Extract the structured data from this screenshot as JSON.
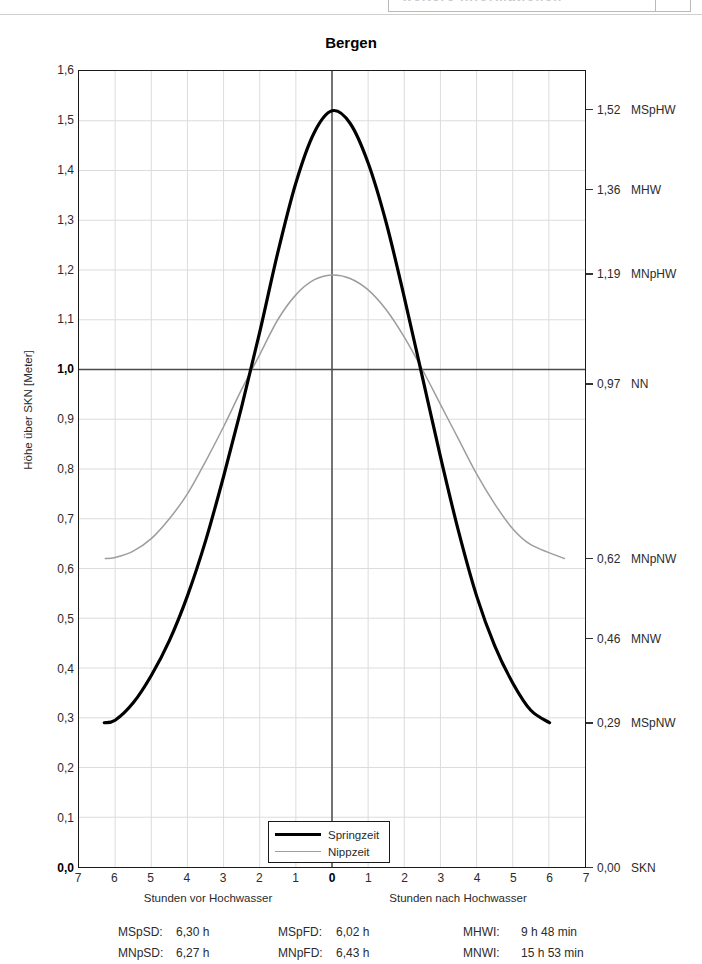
{
  "header": {
    "fragment_text": "weitere Informationen",
    "visible": true
  },
  "chart_title": "Bergen",
  "axes": {
    "y_axis_title": "Höhe über SKN [Meter]",
    "y_ticks": [
      "1,6",
      "1,5",
      "1,4",
      "1,3",
      "1,2",
      "1,1",
      "1,0",
      "0,9",
      "0,8",
      "0,7",
      "0,6",
      "0,5",
      "0,4",
      "0,3",
      "0,2",
      "0,1",
      "0,0"
    ],
    "y_tick_values": [
      1.6,
      1.5,
      1.4,
      1.3,
      1.2,
      1.1,
      1.0,
      0.9,
      0.8,
      0.7,
      0.6,
      0.5,
      0.4,
      0.3,
      0.2,
      0.1,
      0.0
    ],
    "y_bold_ticks": [
      "1,0",
      "0,0"
    ],
    "x_ticks": [
      "7",
      "6",
      "5",
      "4",
      "3",
      "2",
      "1",
      "0",
      "1",
      "2",
      "3",
      "4",
      "5",
      "6",
      "7"
    ],
    "x_tick_values": [
      -7,
      -6,
      -5,
      -4,
      -3,
      -2,
      -1,
      0,
      1,
      2,
      3,
      4,
      5,
      6,
      7
    ],
    "x_bold_ticks": [
      "0"
    ],
    "x_caption_left": "Stunden vor Hochwasser",
    "x_caption_right": "Stunden nach Hochwasser"
  },
  "reference_levels": [
    {
      "value": "1,52",
      "name": "MSpHW",
      "y": 1.52
    },
    {
      "value": "1,36",
      "name": "MHW",
      "y": 1.36
    },
    {
      "value": "1,19",
      "name": "MNpHW",
      "y": 1.19
    },
    {
      "value": "0,97",
      "name": "NN",
      "y": 0.97
    },
    {
      "value": "0,62",
      "name": "MNpNW",
      "y": 0.62
    },
    {
      "value": "0,46",
      "name": "MNW",
      "y": 0.46
    },
    {
      "value": "0,29",
      "name": "MSpNW",
      "y": 0.29
    },
    {
      "value": "0,00",
      "name": "SKN",
      "y": 0.0
    }
  ],
  "legend": {
    "items": [
      {
        "label": "Springzeit",
        "style": "thick",
        "color": "#000000"
      },
      {
        "label": "Nippzeit",
        "style": "thin",
        "color": "#9d9d9d"
      }
    ]
  },
  "stats": {
    "rows": [
      [
        {
          "key": "MSpSD:",
          "value": "6,30 h"
        },
        {
          "key": "MSpFD:",
          "value": "6,02 h"
        },
        {
          "key": "MHWI:",
          "value": "9 h 48 min"
        }
      ],
      [
        {
          "key": "MNpSD:",
          "value": "6,27 h"
        },
        {
          "key": "MNpFD:",
          "value": "6,43 h"
        },
        {
          "key": "MNWI:",
          "value": "15 h 53 min"
        }
      ]
    ]
  },
  "colors": {
    "spring_curve": "#000000",
    "nipp_curve": "#9d9d9d",
    "grid": "#dcdcdc",
    "axis": "#1a1a1a",
    "reference_line": "#4a4a4a"
  },
  "chart_data": {
    "type": "line",
    "title": "Bergen",
    "xlabel": "Stunden vor / nach Hochwasser",
    "ylabel": "Höhe über SKN [Meter]",
    "xlim": [
      -7,
      7
    ],
    "ylim": [
      0.0,
      1.6
    ],
    "grid": true,
    "legend_position": "bottom-center",
    "annotations": {
      "horizontal_reference_line": {
        "label": "NN",
        "value": 0.97
      },
      "vertical_reference_line": {
        "label": "Hochwasser",
        "value": 0
      }
    },
    "series": [
      {
        "name": "Springzeit",
        "color": "#000000",
        "high_water": 1.52,
        "low_water": 0.29,
        "x": [
          -6.3,
          -6.0,
          -5.5,
          -5.0,
          -4.5,
          -4.0,
          -3.5,
          -3.0,
          -2.5,
          -2.0,
          -1.5,
          -1.0,
          -0.5,
          0,
          0.5,
          1.0,
          1.5,
          2.0,
          2.5,
          3.0,
          3.5,
          4.0,
          4.5,
          5.0,
          5.5,
          6.02
        ],
        "values": [
          0.29,
          0.295,
          0.33,
          0.385,
          0.455,
          0.545,
          0.655,
          0.785,
          0.925,
          1.075,
          1.235,
          1.375,
          1.475,
          1.52,
          1.495,
          1.415,
          1.295,
          1.145,
          0.985,
          0.825,
          0.675,
          0.545,
          0.445,
          0.37,
          0.315,
          0.29
        ]
      },
      {
        "name": "Nippzeit",
        "color": "#9d9d9d",
        "high_water": 1.19,
        "low_water": 0.62,
        "x": [
          -6.27,
          -6.0,
          -5.5,
          -5.0,
          -4.5,
          -4.0,
          -3.5,
          -3.0,
          -2.5,
          -2.0,
          -1.5,
          -1.0,
          -0.5,
          0,
          0.5,
          1.0,
          1.5,
          2.0,
          2.5,
          3.0,
          3.5,
          4.0,
          4.5,
          5.0,
          5.5,
          6.43
        ],
        "values": [
          0.62,
          0.622,
          0.635,
          0.66,
          0.7,
          0.75,
          0.815,
          0.885,
          0.96,
          1.03,
          1.1,
          1.15,
          1.18,
          1.19,
          1.183,
          1.16,
          1.12,
          1.065,
          1.0,
          0.93,
          0.86,
          0.79,
          0.73,
          0.68,
          0.648,
          0.62
        ]
      }
    ]
  }
}
